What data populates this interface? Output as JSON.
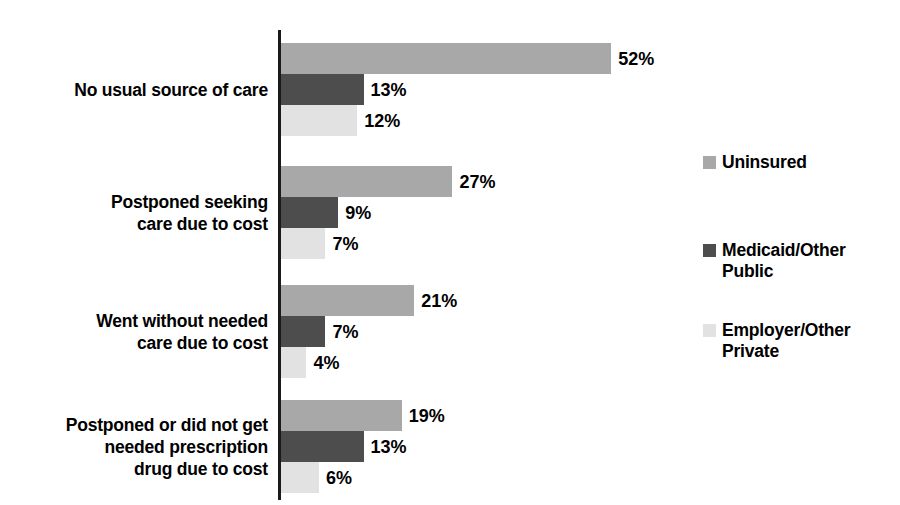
{
  "chart_data": {
    "type": "bar",
    "orientation": "horizontal",
    "title": "",
    "subtitle": "",
    "xlabel": "",
    "ylabel": "",
    "xlim": [
      0,
      52
    ],
    "grid": false,
    "legend_position": "right",
    "value_suffix": "%",
    "px_per_unit": 6.35,
    "categories": [
      "No usual source of care",
      "Postponed seeking\ncare due to cost",
      "Went without needed\ncare due to cost",
      "Postponed or did not get\nneeded prescription\ndrug due to cost"
    ],
    "series": [
      {
        "name": "Uninsured",
        "color": "#a8a8a8",
        "values": [
          52,
          27,
          21,
          19
        ],
        "labels": [
          "52%",
          "27%",
          "21%",
          "19%"
        ]
      },
      {
        "name": "Medicaid/Other\nPublic",
        "color": "#4d4d4d",
        "values": [
          13,
          9,
          7,
          13
        ],
        "labels": [
          "13%",
          "9%",
          "7%",
          "13%"
        ]
      },
      {
        "name": "Employer/Other\nPrivate",
        "color": "#e2e2e2",
        "values": [
          12,
          7,
          4,
          6
        ],
        "labels": [
          "12%",
          "7%",
          "4%",
          "6%"
        ]
      }
    ]
  },
  "legend": {
    "items": [
      {
        "label": "Uninsured",
        "color": "#a8a8a8",
        "top": 0
      },
      {
        "label": "Medicaid/Other\nPublic",
        "color": "#4d4d4d",
        "top": 88
      },
      {
        "label": "Employer/Other\nPrivate",
        "color": "#e2e2e2",
        "top": 168
      }
    ]
  },
  "layout": {
    "axis_x": 278,
    "axis_top": 30,
    "axis_height": 470,
    "bar_height": 31,
    "group_tops": [
      43,
      166,
      285,
      400
    ]
  }
}
